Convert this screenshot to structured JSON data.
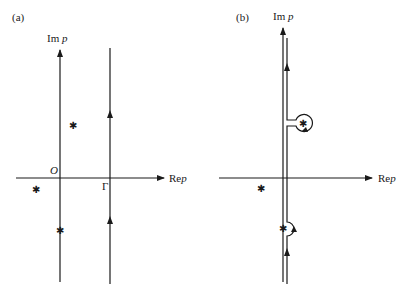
{
  "figure": {
    "panels": [
      {
        "id": "a",
        "label": "(a)",
        "imag_axis_label": "Im p",
        "real_axis_label": "Re p",
        "origin_label": "O",
        "contour_label": "Γ",
        "singularities": 3,
        "contour": "vertical line right of all singularities, directed upward"
      },
      {
        "id": "b",
        "label": "(b)",
        "imag_axis_label": "Im p",
        "real_axis_label": "Re p",
        "singularities": 3,
        "contour": "deformed vertical contour hugging imaginary axis, keyhole loop around upper-right singularity, semicircular indent around singularity on axis, directed upward"
      }
    ]
  },
  "labels": {
    "a_panel": "(a)",
    "a_im": "Im",
    "a_im_var": "p",
    "a_origin": "O",
    "a_gamma": "Γ",
    "a_re": "Re",
    "a_re_var": "p",
    "b_panel": "(b)",
    "b_im": "Im",
    "b_im_var": "p",
    "b_re": "Re",
    "b_re_var": "p",
    "star": "✱"
  }
}
